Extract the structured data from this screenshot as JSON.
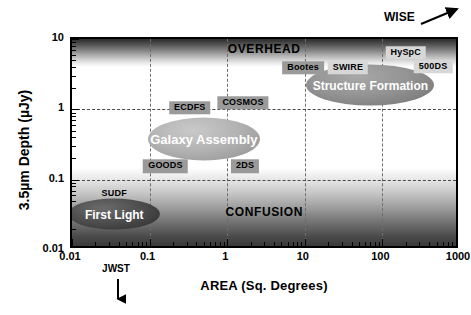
{
  "chart_data": {
    "type": "scatter",
    "title": "",
    "xlabel": "AREA (Sq. Degrees)",
    "ylabel": "3.5µm Depth (µJy)",
    "xscale": "log",
    "yscale": "log",
    "xlim": [
      0.01,
      1000
    ],
    "ylim": [
      0.01,
      10
    ],
    "grid": true,
    "legend": "none",
    "xticks": [
      "0.01",
      "0.1",
      "1",
      "10",
      "100",
      "1000"
    ],
    "xtick_values": [
      0.01,
      0.1,
      1,
      10,
      100,
      1000
    ],
    "yticks": [
      "10",
      "1",
      "0.1",
      "0.01"
    ],
    "ytick_values": [
      10,
      1,
      0.1,
      0.01
    ],
    "regions": [
      {
        "label": "OVERHEAD",
        "x": 3.0,
        "y": 7.2,
        "shading": "dark-to-white-downward"
      },
      {
        "label": "CONFUSION",
        "x": 3.0,
        "y": 0.035,
        "shading": "white-to-dark-downward"
      }
    ],
    "surveys": [
      {
        "label": "HySpC",
        "x": 200,
        "y": 6.4
      },
      {
        "label": "500DS",
        "x": 450,
        "y": 4.0
      },
      {
        "label": "Bootes",
        "x": 9.5,
        "y": 3.9
      },
      {
        "label": "SWIRE",
        "x": 36,
        "y": 3.9
      },
      {
        "label": "ECDFS",
        "x": 0.33,
        "y": 1.05
      },
      {
        "label": "COSMOS",
        "x": 1.6,
        "y": 1.25
      },
      {
        "label": "GOODS",
        "x": 0.16,
        "y": 0.155
      },
      {
        "label": "2DS",
        "x": 1.7,
        "y": 0.155
      },
      {
        "label": "SUDF",
        "x": 0.035,
        "y": 0.062
      }
    ],
    "science_ellipses": [
      {
        "label": "First Light",
        "x": 0.035,
        "y": 0.032,
        "width_px": 92,
        "height_px": 31,
        "fill": "#3f3f3f",
        "text_color": "#ffffff"
      },
      {
        "label": "Galaxy Assembly",
        "x": 0.5,
        "y": 0.38,
        "width_px": 112,
        "height_px": 43,
        "fill": "#a6a6a6",
        "text_color": "#ffffff"
      },
      {
        "label": "Structure Formation",
        "x": 70,
        "y": 2.2,
        "width_px": 128,
        "height_px": 41,
        "fill": "#8b8b8b",
        "text_color": "#ffffff"
      }
    ],
    "annotations": [
      {
        "label": "WISE",
        "type": "arrow",
        "direction": "up-right",
        "x": 1500,
        "y": 14
      },
      {
        "label": "JWST",
        "type": "arrow",
        "direction": "down",
        "x": 0.1,
        "y": 0.004
      }
    ]
  },
  "axes": {
    "x_title": "AREA (Sq. Degrees)",
    "y_title": "3.5µm Depth (µJy)"
  },
  "colors": {
    "frame": "#000000",
    "gridline": "#555555",
    "overhead_band": "#2b2b2b",
    "confusion_band": "#3a3a3a",
    "survey_box_light": "#d7d7d7",
    "survey_box_dark": "#9a9a9a"
  }
}
